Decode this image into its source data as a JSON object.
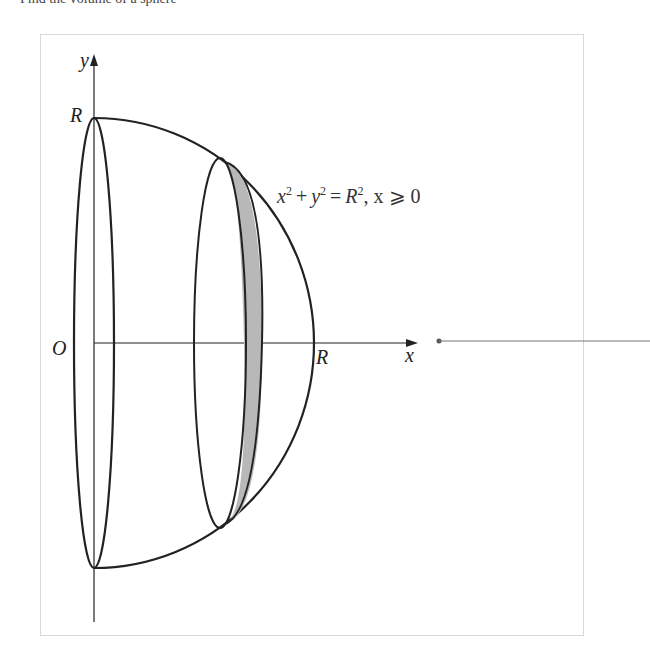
{
  "page": {
    "cut_off_heading": "Find the volume of a sphere"
  },
  "figure": {
    "axes": {
      "x_label": "x",
      "y_label": "y",
      "origin_label": "O",
      "x_intercept_label": "R",
      "y_intercept_label": "R"
    },
    "equation": {
      "lhs_x": "x",
      "sup_x": "2",
      "plus": "+",
      "lhs_y": "y",
      "sup_y": "2",
      "equals": "=",
      "rhs_R": "R",
      "sup_R": "2",
      "condition": ", x ⩾ 0"
    },
    "shading_color": "#b8b8b8",
    "stroke_color": "#222222"
  }
}
